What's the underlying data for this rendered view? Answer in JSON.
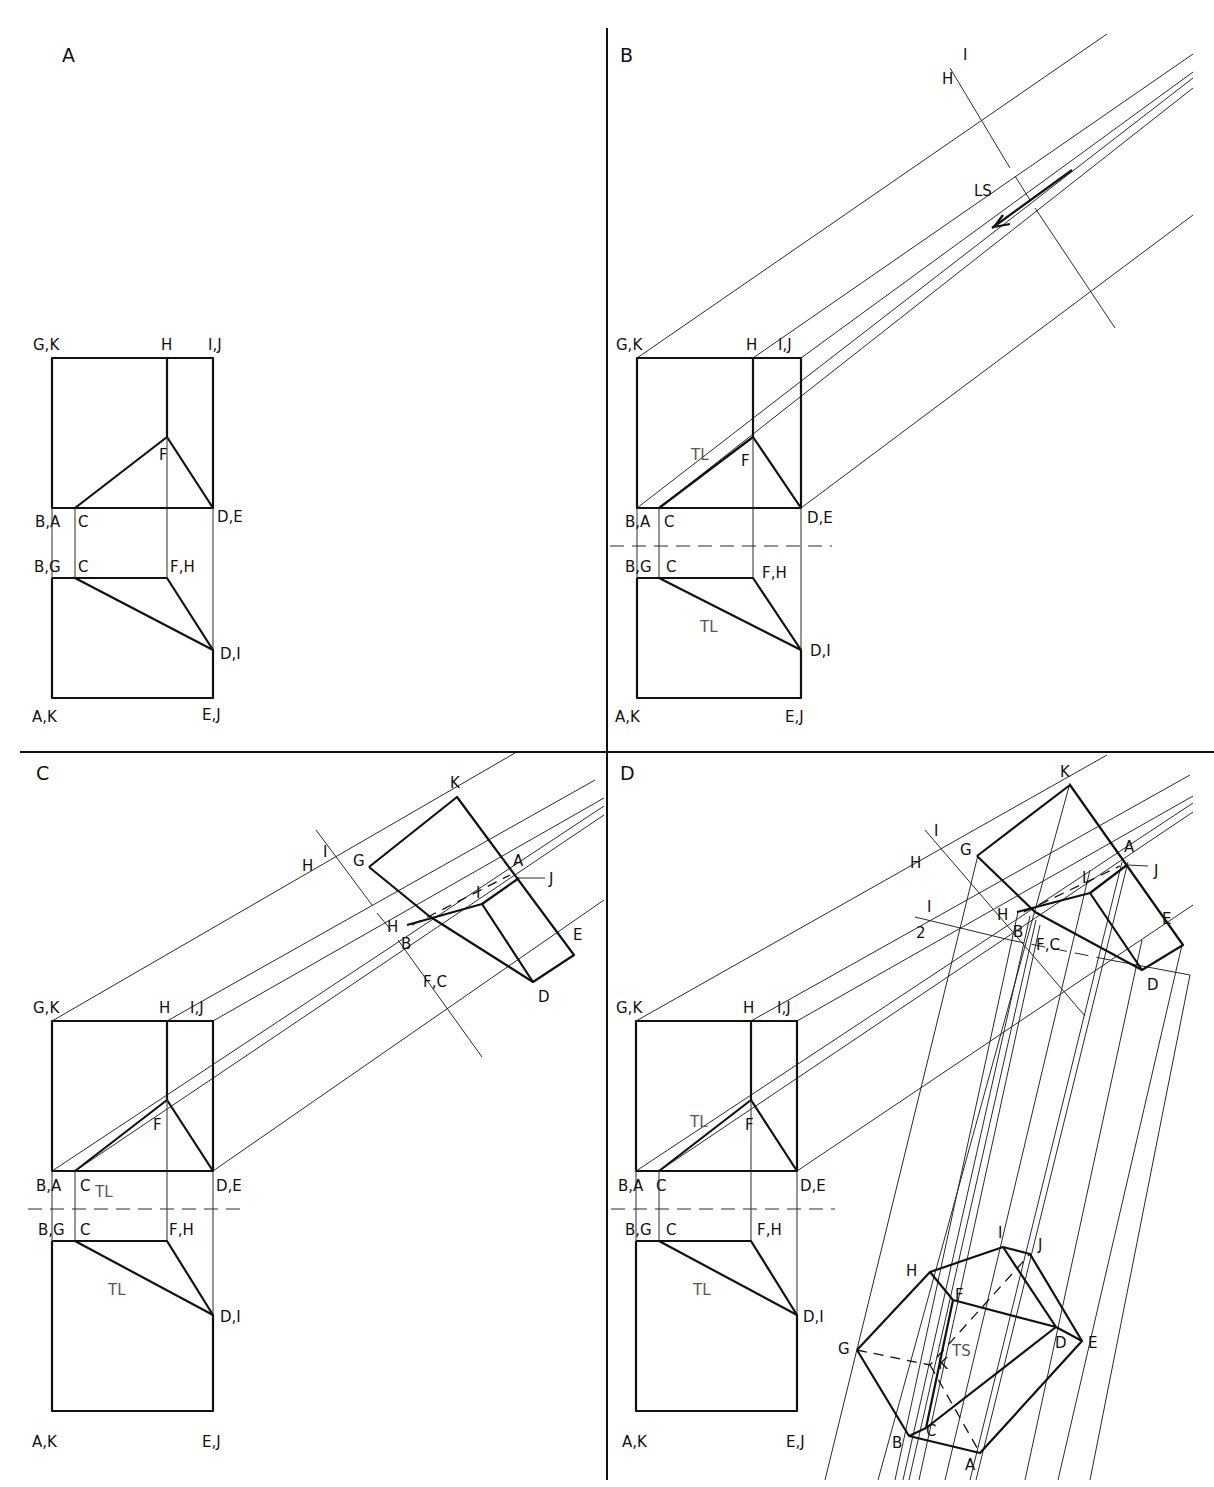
{
  "figure": {
    "panels": [
      {
        "id": "A",
        "label": "A"
      },
      {
        "id": "B",
        "label": "B"
      },
      {
        "id": "C",
        "label": "C"
      },
      {
        "id": "D",
        "label": "D"
      }
    ],
    "common_labels": {
      "top_view": {
        "gk": "G,K",
        "h": "H",
        "ij": "I,J",
        "f": "F",
        "ba": "B,A",
        "c": "C",
        "de": "D,E",
        "tl": "TL"
      },
      "front_view": {
        "bg": "B,G",
        "c": "C",
        "fh": "F,H",
        "di": "D,I",
        "ak": "A,K",
        "ej": "E,J",
        "tl": "TL"
      }
    },
    "panel_b": {
      "fold_i": "I",
      "fold_h": "H",
      "ls": "LS"
    },
    "panel_c": {
      "fold_i": "I",
      "fold_h": "H",
      "aux": {
        "k": "K",
        "g": "G",
        "a": "A",
        "j": "J",
        "i": "I",
        "h": "H",
        "b": "B",
        "e": "E",
        "fc": "F,C",
        "d": "D"
      }
    },
    "panel_d": {
      "fold_i": "I",
      "fold_h": "H",
      "fold2_1": "I",
      "fold2_2": "2",
      "aux": {
        "k": "K",
        "g": "G",
        "a": "A",
        "j": "J",
        "i": "I",
        "h": "H",
        "b": "B",
        "e": "E",
        "fc": "F,C",
        "d": "D"
      },
      "true_shape": {
        "i": "I",
        "j": "J",
        "h": "H",
        "f": "F",
        "g": "G",
        "ts": "TS",
        "k": "K",
        "d": "D",
        "e": "E",
        "c": "C",
        "b": "B",
        "a": "A"
      }
    }
  }
}
